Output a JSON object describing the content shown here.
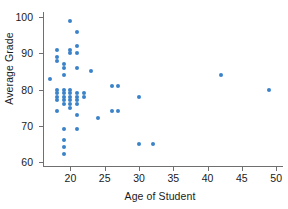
{
  "chart_data": {
    "type": "scatter",
    "title": "",
    "xlabel": "Age of Student",
    "ylabel": "Average Grade",
    "xlim": [
      16,
      51
    ],
    "ylim": [
      58.5,
      101.5
    ],
    "xticks": [
      20,
      25,
      30,
      35,
      40,
      45,
      50
    ],
    "yticks": [
      60,
      70,
      80,
      90,
      100
    ],
    "xtick_labels": [
      "20",
      "25",
      "30",
      "35",
      "40",
      "45",
      "50"
    ],
    "ytick_labels": [
      "60",
      "70",
      "80",
      "90",
      "100"
    ],
    "grid": false,
    "legend": null,
    "marker_color": "#3b83c9",
    "axis_color": "#6f6f6f",
    "points": [
      [
        17,
        83
      ],
      [
        18,
        91
      ],
      [
        18,
        89
      ],
      [
        18,
        88
      ],
      [
        18,
        80
      ],
      [
        18,
        79
      ],
      [
        18,
        78
      ],
      [
        18,
        77
      ],
      [
        18,
        74
      ],
      [
        19,
        87
      ],
      [
        19,
        84
      ],
      [
        19,
        86
      ],
      [
        19,
        80
      ],
      [
        19,
        79
      ],
      [
        19,
        78
      ],
      [
        19,
        77
      ],
      [
        19,
        76
      ],
      [
        19,
        69
      ],
      [
        19,
        66
      ],
      [
        19,
        64
      ],
      [
        19,
        62
      ],
      [
        20,
        99
      ],
      [
        20,
        91
      ],
      [
        20,
        90
      ],
      [
        20,
        80
      ],
      [
        20,
        79
      ],
      [
        20,
        78
      ],
      [
        20,
        77
      ],
      [
        20,
        76
      ],
      [
        20,
        75
      ],
      [
        21,
        96
      ],
      [
        21,
        92
      ],
      [
        21,
        90
      ],
      [
        21,
        86
      ],
      [
        21,
        79
      ],
      [
        21,
        78
      ],
      [
        21,
        77
      ],
      [
        21,
        76
      ],
      [
        21,
        73
      ],
      [
        21,
        69
      ],
      [
        22,
        79
      ],
      [
        22,
        78
      ],
      [
        23,
        85
      ],
      [
        24,
        72
      ],
      [
        26,
        81
      ],
      [
        26,
        74
      ],
      [
        27,
        81
      ],
      [
        27,
        74
      ],
      [
        30,
        78
      ],
      [
        30,
        65
      ],
      [
        32,
        65
      ],
      [
        42,
        84
      ],
      [
        49,
        80
      ]
    ]
  }
}
